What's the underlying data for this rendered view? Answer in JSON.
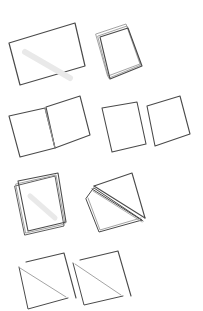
{
  "diagram": {
    "title": "Paper folding steps",
    "background": "#ffffff",
    "stroke_color": "#4a4a4a",
    "light_stroke_color": "#9a9a9a",
    "shading_color": "#e9e9e9",
    "steps": [
      {
        "id": "step-1",
        "label": "Flat rectangular sheet",
        "polys": [
          {
            "pts": "9,43 75,23 85,66 20,85",
            "w": 1.2,
            "tone": "dark",
            "fill": "white"
          }
        ],
        "lines": [
          {
            "pts": "25,52 70,78",
            "w": 6,
            "tone": "shade"
          }
        ]
      },
      {
        "id": "step-2",
        "label": "Sheet folded in half (card)",
        "polys": [
          {
            "pts": "96,34 126,24 140,64 108,76",
            "w": 0.9,
            "tone": "light",
            "fill": "white"
          },
          {
            "pts": "98,36 127,26 141,65 109,78",
            "w": 0.9,
            "tone": "light",
            "fill": "white"
          },
          {
            "pts": "100,37 128,28 142,66 110,79",
            "w": 1.1,
            "tone": "dark",
            "fill": "white"
          }
        ],
        "lines": []
      },
      {
        "id": "step-3",
        "label": "Sheet opened like a book",
        "polys": [
          {
            "pts": "9,116 45,108 55,148 20,157",
            "w": 1.1,
            "tone": "dark",
            "fill": "white"
          },
          {
            "pts": "46,107 80,96 90,135 55,148",
            "w": 1.1,
            "tone": "dark",
            "fill": "white"
          }
        ],
        "lines": [
          {
            "pts": "45,108 55,148",
            "w": 1,
            "tone": "light"
          }
        ]
      },
      {
        "id": "step-4",
        "label": "Sheet cut into two squares",
        "polys": [
          {
            "pts": "102,108 137,102 146,144 112,152",
            "w": 1.1,
            "tone": "dark",
            "fill": "white"
          },
          {
            "pts": "147,106 180,96 190,134 155,146",
            "w": 1.1,
            "tone": "dark",
            "fill": "white"
          }
        ],
        "lines": []
      },
      {
        "id": "step-5",
        "label": "Squares stacked",
        "polys": [
          {
            "pts": "15,186 55,176 64,226 25,235",
            "w": 0.9,
            "tone": "dark",
            "fill": "white"
          },
          {
            "pts": "16,184 56,175 65,224 26,233",
            "w": 0.9,
            "tone": "light",
            "fill": "white"
          },
          {
            "pts": "18,181 58,173 66,222 28,231",
            "w": 1.1,
            "tone": "dark",
            "fill": "white"
          }
        ],
        "lines": [
          {
            "pts": "30,196 55,218",
            "w": 5,
            "tone": "shade"
          }
        ]
      },
      {
        "id": "step-6",
        "label": "Stack folded along the diagonal",
        "polys": [
          {
            "pts": "86,199 99,232 142,220 94,188",
            "w": 1.0,
            "tone": "dark",
            "fill": "white"
          },
          {
            "pts": "88,198 100,230 141,218",
            "w": 0.9,
            "tone": "light",
            "fill": "none"
          },
          {
            "pts": "94,186 132,173 145,218",
            "w": 1.1,
            "tone": "dark",
            "fill": "none"
          }
        ],
        "lines": [
          {
            "pts": "94,186 145,218",
            "w": 1.1,
            "tone": "dark"
          },
          {
            "pts": "92,189 143,221",
            "w": 1.0,
            "tone": "dark"
          },
          {
            "pts": "93,191 142,222",
            "w": 0.8,
            "tone": "light"
          }
        ]
      },
      {
        "id": "step-7",
        "label": "Squares cut into triangles",
        "polys": [
          {
            "pts": "19,267 28,309 68,298",
            "w": 1.0,
            "tone": "dark",
            "fill": "none"
          },
          {
            "pts": "26,262 64,253 76,298",
            "w": 1.1,
            "tone": "dark",
            "fill": "none"
          },
          {
            "pts": "73,263 84,305 123,296",
            "w": 1.0,
            "tone": "dark",
            "fill": "none"
          },
          {
            "pts": "80,260 118,251 131,296",
            "w": 1.1,
            "tone": "dark",
            "fill": "none"
          }
        ],
        "lines": [
          {
            "pts": "20,268 66,297",
            "w": 0.9,
            "tone": "light"
          },
          {
            "pts": "75,264 121,295",
            "w": 0.9,
            "tone": "light"
          }
        ]
      }
    ]
  }
}
